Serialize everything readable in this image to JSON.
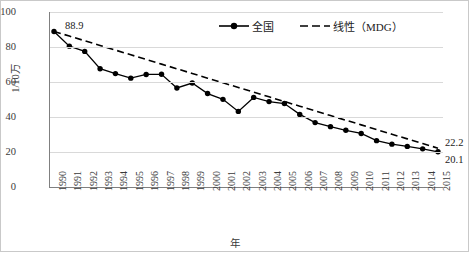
{
  "chart_data": {
    "type": "line",
    "title": "",
    "xlabel": "年",
    "ylabel": "1/10万",
    "ylim": [
      0,
      100
    ],
    "yticks": [
      0,
      20,
      40,
      60,
      80,
      100
    ],
    "grid": true,
    "legend_position": "top-center",
    "categories": [
      "1990",
      "1991",
      "1992",
      "1993",
      "1994",
      "1995",
      "1996",
      "1997",
      "1998",
      "1999",
      "2000",
      "2001",
      "2002",
      "2003",
      "2004",
      "2005",
      "2006",
      "2007",
      "2008",
      "2009",
      "2010",
      "2011",
      "2012",
      "2013",
      "2014",
      "2015"
    ],
    "series": [
      {
        "name": "全国",
        "style": "solid-line-with-markers",
        "values": [
          88.9,
          80.5,
          77.5,
          67.6,
          64.8,
          62.2,
          64.3,
          64.4,
          56.6,
          59.4,
          53.4,
          50.1,
          43.2,
          51.2,
          48.8,
          47.7,
          41.5,
          36.8,
          34.5,
          32.4,
          30.6,
          26.5,
          24.5,
          23.2,
          21.8,
          20.1
        ]
      },
      {
        "name": "线性（MDG）",
        "style": "dashed-line",
        "values": [
          88.9,
          86.23,
          83.56,
          80.89,
          78.22,
          75.55,
          72.88,
          70.21,
          67.54,
          64.87,
          62.2,
          59.53,
          56.86,
          54.19,
          51.52,
          48.85,
          46.18,
          43.51,
          40.84,
          38.17,
          35.5,
          32.83,
          30.16,
          27.49,
          24.82,
          22.2
        ]
      }
    ],
    "annotations": [
      {
        "name": "start-value-label",
        "text": "88.9",
        "series": "全国",
        "category": "1990"
      },
      {
        "name": "mdg-end-label",
        "text": "22.2",
        "series": "线性（MDG）",
        "category": "2015"
      },
      {
        "name": "national-end-label",
        "text": "20.1",
        "series": "全国",
        "category": "2015"
      }
    ],
    "colors": {
      "line": "#000000",
      "marker": "#000000",
      "grid": "#d9d9d9",
      "axis": "#808080",
      "text": "#3a3a3a",
      "background": "#ffffff"
    }
  },
  "legend": {
    "items": [
      {
        "label": "全国",
        "symbol": "solid-line-marker"
      },
      {
        "label": "线性（MDG）",
        "symbol": "dashed-line"
      }
    ]
  }
}
